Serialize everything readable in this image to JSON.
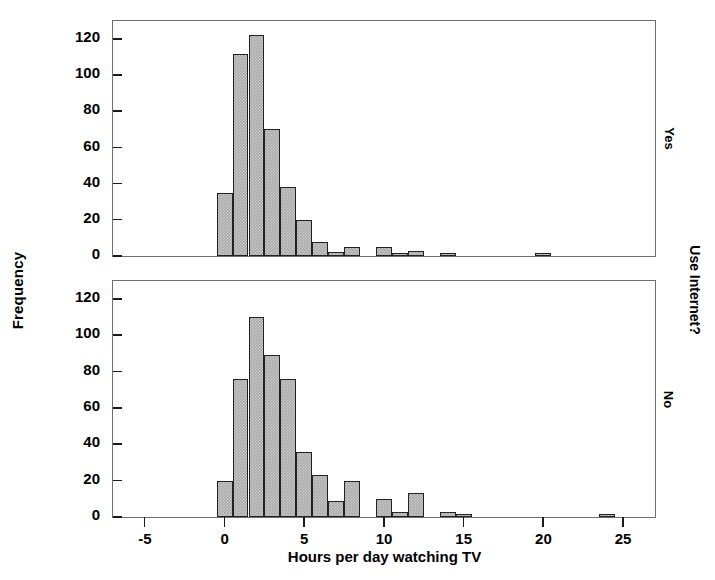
{
  "chart_data": {
    "type": "bar",
    "title": "",
    "xlabel": "Hours per day watching TV",
    "ylabel": "Frequency",
    "group_label": "Use Internet?",
    "xlim": [
      -7,
      27
    ],
    "ylim": [
      0,
      130
    ],
    "bin_width": 1,
    "grid": false,
    "legend": "none",
    "xticks": [
      -5,
      0,
      5,
      10,
      15,
      20,
      25
    ],
    "xtick_labels": [
      "-5",
      "0",
      "5",
      "10",
      "15",
      "20",
      "25"
    ],
    "yticks": [
      0,
      20,
      40,
      60,
      80,
      100,
      120
    ],
    "ytick_labels": [
      "0",
      "20",
      "40",
      "60",
      "80",
      "100",
      "120"
    ],
    "bar_fill_color": "#a9a9a9",
    "bar_edge_color": "#222222",
    "panel_border_color": "#6f6f6f",
    "panels": [
      {
        "row_label": "Yes",
        "x": [
          0,
          1,
          2,
          3,
          4,
          5,
          6,
          7,
          8,
          10,
          11,
          12,
          14,
          20
        ],
        "values": [
          35,
          112,
          122,
          70,
          38,
          20,
          8,
          2,
          5,
          5,
          1,
          3,
          1,
          1
        ]
      },
      {
        "row_label": "No",
        "x": [
          0,
          1,
          2,
          3,
          4,
          5,
          6,
          7,
          8,
          10,
          11,
          12,
          14,
          15,
          24
        ],
        "values": [
          20,
          76,
          110,
          89,
          76,
          36,
          23,
          9,
          20,
          10,
          3,
          13,
          3,
          1,
          1
        ]
      }
    ]
  }
}
